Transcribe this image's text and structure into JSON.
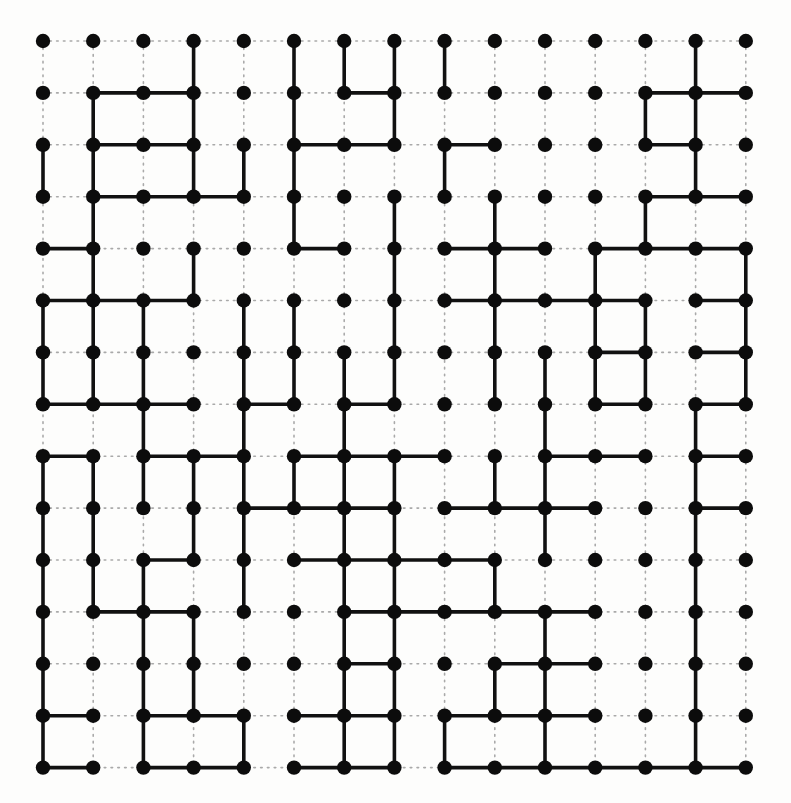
{
  "figure": {
    "type": "lattice-graph",
    "background_color": "#fdfdfc"
  },
  "chart_data": {
    "type": "scatter",
    "xlabel": "",
    "ylabel": "",
    "grid": true,
    "legend_position": "none",
    "lattice": {
      "rows": 15,
      "cols": 15,
      "node_count": 225,
      "origin_x": 43,
      "origin_y": 41,
      "spacing_x": 50.2,
      "spacing_y": 51.9,
      "node_radius": 7.2
    },
    "style": {
      "node_color": "#0c0c0c",
      "open_bond_color": "#111111",
      "open_bond_width": 3.6,
      "lattice_guide_color": "#a9a9a9",
      "lattice_guide_width": 1.6,
      "lattice_guide_dash": "1.6 5.2"
    },
    "horizontal_bonds": [
      [
        1,
        1
      ],
      [
        1,
        2
      ],
      [
        1,
        6
      ],
      [
        1,
        12
      ],
      [
        1,
        13
      ],
      [
        2,
        1
      ],
      [
        2,
        2
      ],
      [
        2,
        5
      ],
      [
        2,
        6
      ],
      [
        2,
        8
      ],
      [
        2,
        12
      ],
      [
        3,
        1
      ],
      [
        3,
        2
      ],
      [
        3,
        3
      ],
      [
        3,
        12
      ],
      [
        3,
        13
      ],
      [
        4,
        0
      ],
      [
        4,
        5
      ],
      [
        4,
        8
      ],
      [
        4,
        9
      ],
      [
        4,
        11
      ],
      [
        4,
        12
      ],
      [
        4,
        13
      ],
      [
        5,
        0
      ],
      [
        5,
        1
      ],
      [
        5,
        2
      ],
      [
        5,
        8
      ],
      [
        5,
        9
      ],
      [
        5,
        10
      ],
      [
        5,
        11
      ],
      [
        5,
        13
      ],
      [
        6,
        11
      ],
      [
        6,
        13
      ],
      [
        7,
        0
      ],
      [
        7,
        1
      ],
      [
        7,
        2
      ],
      [
        7,
        4
      ],
      [
        7,
        6
      ],
      [
        7,
        11
      ],
      [
        7,
        13
      ],
      [
        8,
        0
      ],
      [
        8,
        2
      ],
      [
        8,
        3
      ],
      [
        8,
        5
      ],
      [
        8,
        6
      ],
      [
        8,
        7
      ],
      [
        8,
        10
      ],
      [
        8,
        11
      ],
      [
        8,
        13
      ],
      [
        9,
        4
      ],
      [
        9,
        5
      ],
      [
        9,
        6
      ],
      [
        9,
        8
      ],
      [
        9,
        9
      ],
      [
        9,
        10
      ],
      [
        9,
        13
      ],
      [
        10,
        2
      ],
      [
        10,
        5
      ],
      [
        10,
        6
      ],
      [
        10,
        7
      ],
      [
        10,
        8
      ],
      [
        11,
        1
      ],
      [
        11,
        2
      ],
      [
        11,
        6
      ],
      [
        11,
        7
      ],
      [
        11,
        8
      ],
      [
        11,
        9
      ],
      [
        11,
        10
      ],
      [
        12,
        6
      ],
      [
        12,
        9
      ],
      [
        12,
        10
      ],
      [
        13,
        0
      ],
      [
        13,
        2
      ],
      [
        13,
        3
      ],
      [
        13,
        5
      ],
      [
        13,
        6
      ],
      [
        13,
        8
      ],
      [
        13,
        9
      ],
      [
        13,
        10
      ],
      [
        14,
        0
      ],
      [
        14,
        2
      ],
      [
        14,
        3
      ],
      [
        14,
        5
      ],
      [
        14,
        6
      ],
      [
        14,
        8
      ],
      [
        14,
        9
      ],
      [
        14,
        10
      ],
      [
        14,
        11
      ],
      [
        14,
        12
      ],
      [
        14,
        13
      ]
    ],
    "vertical_bonds": [
      [
        0,
        3
      ],
      [
        0,
        5
      ],
      [
        0,
        6
      ],
      [
        0,
        7
      ],
      [
        0,
        8
      ],
      [
        0,
        13
      ],
      [
        1,
        1
      ],
      [
        1,
        3
      ],
      [
        1,
        5
      ],
      [
        1,
        7
      ],
      [
        1,
        12
      ],
      [
        1,
        13
      ],
      [
        2,
        0
      ],
      [
        2,
        1
      ],
      [
        2,
        3
      ],
      [
        2,
        4
      ],
      [
        2,
        5
      ],
      [
        2,
        8
      ],
      [
        2,
        13
      ],
      [
        3,
        1
      ],
      [
        3,
        5
      ],
      [
        3,
        7
      ],
      [
        3,
        9
      ],
      [
        3,
        12
      ],
      [
        4,
        1
      ],
      [
        4,
        3
      ],
      [
        4,
        7
      ],
      [
        4,
        9
      ],
      [
        4,
        11
      ],
      [
        4,
        14
      ],
      [
        5,
        0
      ],
      [
        5,
        1
      ],
      [
        5,
        2
      ],
      [
        5,
        4
      ],
      [
        5,
        5
      ],
      [
        5,
        7
      ],
      [
        5,
        9
      ],
      [
        5,
        11
      ],
      [
        5,
        12
      ],
      [
        5,
        14
      ],
      [
        6,
        0
      ],
      [
        6,
        1
      ],
      [
        6,
        2
      ],
      [
        6,
        4
      ],
      [
        6,
        5
      ],
      [
        6,
        6
      ],
      [
        6,
        7
      ],
      [
        6,
        9
      ],
      [
        6,
        10
      ],
      [
        6,
        11
      ],
      [
        6,
        12
      ],
      [
        6,
        14
      ],
      [
        7,
        2
      ],
      [
        7,
        4
      ],
      [
        7,
        6
      ],
      [
        7,
        10
      ],
      [
        7,
        13
      ],
      [
        8,
        0
      ],
      [
        8,
        1
      ],
      [
        8,
        2
      ],
      [
        8,
        3
      ],
      [
        8,
        4
      ],
      [
        8,
        5
      ],
      [
        8,
        6
      ],
      [
        8,
        7
      ],
      [
        8,
        9
      ],
      [
        8,
        10
      ],
      [
        8,
        13
      ],
      [
        9,
        0
      ],
      [
        9,
        1
      ],
      [
        9,
        3
      ],
      [
        9,
        4
      ],
      [
        9,
        6
      ],
      [
        9,
        7
      ],
      [
        9,
        10
      ],
      [
        9,
        13
      ],
      [
        10,
        0
      ],
      [
        10,
        1
      ],
      [
        10,
        2
      ],
      [
        10,
        4
      ],
      [
        10,
        6
      ],
      [
        10,
        7
      ],
      [
        10,
        9
      ],
      [
        10,
        13
      ],
      [
        11,
        0
      ],
      [
        11,
        2
      ],
      [
        11,
        3
      ],
      [
        11,
        6
      ],
      [
        11,
        7
      ],
      [
        11,
        10
      ],
      [
        11,
        13
      ],
      [
        12,
        0
      ],
      [
        12,
        2
      ],
      [
        12,
        3
      ],
      [
        12,
        6
      ],
      [
        12,
        7
      ],
      [
        12,
        9
      ],
      [
        12,
        10
      ],
      [
        12,
        13
      ],
      [
        13,
        0
      ],
      [
        13,
        2
      ],
      [
        13,
        4
      ],
      [
        13,
        6
      ],
      [
        13,
        7
      ],
      [
        13,
        8
      ],
      [
        13,
        10
      ],
      [
        13,
        13
      ]
    ]
  }
}
